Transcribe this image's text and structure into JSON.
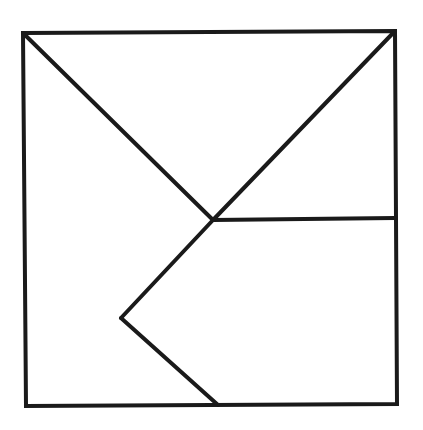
{
  "diagram": {
    "type": "tangram-style square dissection",
    "stroke_color": "#1a1a1a",
    "background_color": "#ffffff",
    "stroke_width": 4,
    "outer_square": {
      "top_left": [
        23,
        33
      ],
      "top_right": [
        395,
        31
      ],
      "bottom_right": [
        397,
        404
      ],
      "bottom_left": [
        26,
        406
      ]
    },
    "points": {
      "center": [
        213,
        220
      ],
      "right_mid": [
        395,
        218
      ],
      "left_vertex": [
        121,
        318
      ],
      "bottom_mid": [
        218,
        405
      ]
    },
    "segments": [
      {
        "name": "diagonal-top-left-to-center",
        "from": [
          23,
          33
        ],
        "to": [
          213,
          220
        ]
      },
      {
        "name": "diagonal-top-right-to-center",
        "from": [
          395,
          31
        ],
        "to": [
          213,
          220
        ]
      },
      {
        "name": "horizontal-center-to-right",
        "from": [
          213,
          220
        ],
        "to": [
          395,
          218
        ]
      },
      {
        "name": "center-to-left-vertex",
        "from": [
          213,
          220
        ],
        "to": [
          121,
          318
        ]
      },
      {
        "name": "left-vertex-to-bottom",
        "from": [
          121,
          318
        ],
        "to": [
          218,
          405
        ]
      }
    ]
  }
}
